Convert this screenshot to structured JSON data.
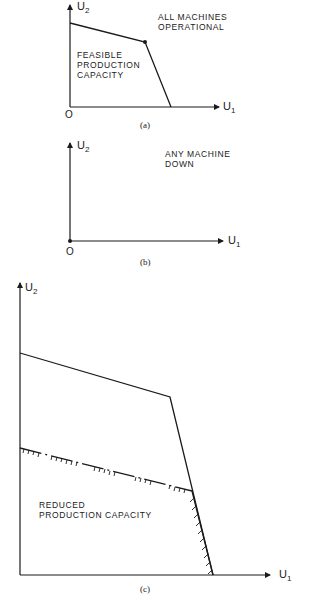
{
  "panels": [
    {
      "id": "a",
      "caption": "(a)",
      "title_lines": [
        "ALL MACHINES",
        "OPERATIONAL"
      ],
      "region_label_lines": [
        "FEASIBLE",
        "PRODUCTION",
        "CAPACITY"
      ],
      "x_axis_label": "U",
      "x_axis_sub": "1",
      "y_axis_label": "U",
      "y_axis_sub": "2",
      "origin_label": "O"
    },
    {
      "id": "b",
      "caption": "(b)",
      "title_lines": [
        "ANY MACHINE",
        "DOWN"
      ],
      "x_axis_label": "U",
      "x_axis_sub": "1",
      "y_axis_label": "U",
      "y_axis_sub": "2",
      "origin_label": "O"
    },
    {
      "id": "c",
      "caption": "(c)",
      "region_label_lines": [
        "REDUCED",
        "PRODUCTION CAPACITY"
      ],
      "x_axis_label": "U",
      "x_axis_sub": "1",
      "y_axis_label": "U",
      "y_axis_sub": "2"
    }
  ]
}
